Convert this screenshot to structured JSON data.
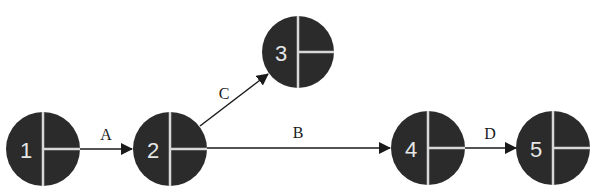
{
  "diagram": {
    "type": "activity-on-arrow network",
    "nodes": [
      {
        "id": "1",
        "label": "1",
        "cx": 43,
        "cy": 149
      },
      {
        "id": "2",
        "label": "2",
        "cx": 170,
        "cy": 149
      },
      {
        "id": "3",
        "label": "3",
        "cx": 298,
        "cy": 52
      },
      {
        "id": "4",
        "label": "4",
        "cx": 428,
        "cy": 148
      },
      {
        "id": "5",
        "label": "5",
        "cx": 553,
        "cy": 148
      }
    ],
    "edges": [
      {
        "from": "1",
        "to": "2",
        "label": "A"
      },
      {
        "from": "2",
        "to": "4",
        "label": "B"
      },
      {
        "from": "2",
        "to": "3",
        "label": "C"
      },
      {
        "from": "4",
        "to": "5",
        "label": "D"
      }
    ],
    "colors": {
      "node_fill": "#2b2b2b",
      "divider": "#d8d8d8",
      "edge": "#1a1a1a"
    }
  }
}
